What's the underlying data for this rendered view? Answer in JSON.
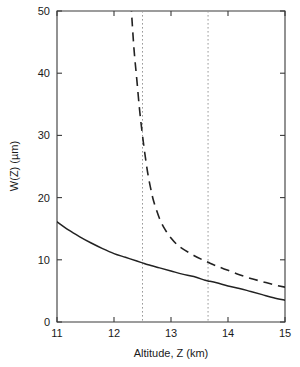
{
  "chart_data": {
    "type": "line",
    "title": "",
    "xlabel": "Altitude, Z (km)",
    "ylabel": "W(Z) (µm)",
    "xlim": [
      11,
      15
    ],
    "ylim": [
      0,
      50
    ],
    "xticks": [
      11,
      12,
      13,
      14,
      15
    ],
    "xtick_labels": [
      "11",
      "12",
      "13",
      "14",
      "15"
    ],
    "yticks": [
      0,
      10,
      20,
      30,
      40,
      50
    ],
    "ytick_labels": [
      "0",
      "10",
      "20",
      "30",
      "40",
      "50"
    ],
    "grid": false,
    "legend": null,
    "series": [
      {
        "name": "solid-curve",
        "style": "solid",
        "color": "#222222",
        "x": [
          11.0,
          11.2,
          11.4,
          11.6,
          11.8,
          12.0,
          12.2,
          12.4,
          12.5,
          12.6,
          12.8,
          13.0,
          13.2,
          13.4,
          13.6,
          13.65,
          13.8,
          14.0,
          14.2,
          14.4,
          14.6,
          14.8,
          15.0
        ],
        "y": [
          16.1,
          14.8,
          13.7,
          12.7,
          11.8,
          11.0,
          10.4,
          9.8,
          9.5,
          9.2,
          8.7,
          8.2,
          7.7,
          7.3,
          6.7,
          6.6,
          6.3,
          5.8,
          5.4,
          4.9,
          4.4,
          3.9,
          3.5
        ]
      },
      {
        "name": "dashed-curve",
        "style": "dashed",
        "color": "#222222",
        "asymptote_x": 12.15,
        "x": [
          12.2,
          12.25,
          12.3,
          12.35,
          12.4,
          12.45,
          12.5,
          12.55,
          12.6,
          12.65,
          12.7,
          12.8,
          12.9,
          13.0,
          13.1,
          13.2,
          13.4,
          13.6,
          13.65,
          13.8,
          14.0,
          14.2,
          14.4,
          14.6,
          14.8,
          15.0
        ],
        "y": [
          70.0,
          60.0,
          51.0,
          44.0,
          39.0,
          34.0,
          30.0,
          26.5,
          23.5,
          21.2,
          19.3,
          16.6,
          14.8,
          13.5,
          12.5,
          11.8,
          10.7,
          9.8,
          9.6,
          9.0,
          8.3,
          7.6,
          7.0,
          6.5,
          6.0,
          5.6
        ]
      }
    ],
    "vertical_markers": [
      {
        "name": "marker-12-5",
        "x": 12.5,
        "style": "dotted",
        "color": "#9a9a9a"
      },
      {
        "name": "marker-13-65",
        "x": 13.65,
        "style": "dotted",
        "color": "#9a9a9a"
      }
    ]
  }
}
